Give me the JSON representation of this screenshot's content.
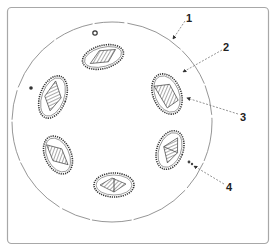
{
  "diagram": {
    "type": "petri-dish-colonies",
    "colors": {
      "frame": "#a8a8a8",
      "dish": "#8a8a8a",
      "colony_border": "#333333",
      "hatch": "#555555",
      "leader": "#7a7a7a",
      "label": "#222222"
    },
    "labels": [
      {
        "id": "1",
        "text": "1"
      },
      {
        "id": "2",
        "text": "2"
      },
      {
        "id": "3",
        "text": "3"
      },
      {
        "id": "4",
        "text": "4"
      }
    ]
  }
}
